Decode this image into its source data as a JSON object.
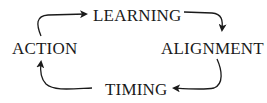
{
  "diagram": {
    "type": "cycle",
    "nodes": [
      {
        "id": "learning",
        "label": "LEARNING"
      },
      {
        "id": "alignment",
        "label": "ALIGNMENT"
      },
      {
        "id": "timing",
        "label": "TIMING"
      },
      {
        "id": "action",
        "label": "ACTION"
      }
    ],
    "edges": [
      {
        "from": "action",
        "to": "learning"
      },
      {
        "from": "learning",
        "to": "alignment"
      },
      {
        "from": "alignment",
        "to": "timing"
      },
      {
        "from": "timing",
        "to": "action"
      }
    ],
    "colors": {
      "text": "#1a1a1a",
      "arrow": "#1a1a1a",
      "background": "#ffffff"
    }
  }
}
